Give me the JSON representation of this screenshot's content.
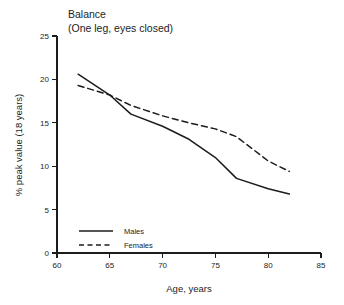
{
  "chart_data": {
    "type": "line",
    "title": "Balance",
    "subtitle": "(One leg, eyes closed)",
    "xlabel": "Age, years",
    "ylabel": "% peak value (18 years)",
    "xlim": [
      60,
      85
    ],
    "ylim": [
      0,
      25
    ],
    "xticks": [
      60,
      65,
      70,
      75,
      80,
      85
    ],
    "yticks": [
      0,
      5,
      10,
      15,
      20,
      25
    ],
    "grid": false,
    "legend_position": "bottom-left",
    "series": [
      {
        "name": "Males",
        "style": "solid",
        "color": "#1c1c1c",
        "x": [
          62,
          65,
          67,
          70,
          72.5,
          75,
          77,
          80,
          82
        ],
        "values": [
          20.6,
          18.2,
          16.0,
          14.6,
          13.1,
          11.0,
          8.6,
          7.4,
          6.8
        ]
      },
      {
        "name": "Females",
        "style": "dashed",
        "color": "#1c1c1c",
        "x": [
          62,
          65,
          67,
          70,
          72.5,
          75,
          77,
          80,
          82
        ],
        "values": [
          19.3,
          18.2,
          17.0,
          15.8,
          15.0,
          14.3,
          13.4,
          10.6,
          9.4
        ]
      }
    ]
  },
  "legend": {
    "items": [
      {
        "label": "Males",
        "style": "solid"
      },
      {
        "label": "Females",
        "style": "dashed"
      }
    ]
  },
  "axes": {
    "x_tick_labels": [
      "60",
      "65",
      "70",
      "75",
      "80",
      "85"
    ],
    "y_tick_labels": [
      "0",
      "5",
      "10",
      "15",
      "20",
      "25"
    ]
  }
}
